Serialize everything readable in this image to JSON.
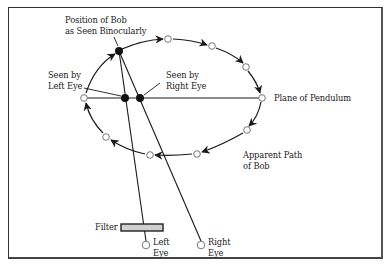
{
  "diagram": {
    "labels": {
      "position_binocular": "Position of Bob\nas Seen Binocularly",
      "seen_by_left": "Seen by\nLeft Eye",
      "seen_by_right": "Seen by\nRight Eye",
      "plane_of_pendulum": "Plane of Pendulum",
      "apparent_path": "Apparent Path\nof Bob",
      "filter": "Filter",
      "left_eye": "Left\nEye",
      "right_eye": "Right\nEye"
    },
    "colors": {
      "line": "#1a1a1a",
      "circle_stroke": "#777777",
      "filter_fill": "#cfcfcf"
    },
    "points": {
      "binocular_bob": [
        119,
        51
      ],
      "left_seen": [
        125,
        98
      ],
      "right_seen": [
        140,
        98
      ],
      "left_eye": [
        146,
        245
      ],
      "right_eye": [
        201,
        245
      ]
    },
    "path_circles": [
      [
        168,
        39
      ],
      [
        212,
        46
      ],
      [
        246,
        67
      ],
      [
        262,
        98
      ],
      [
        247,
        130
      ],
      [
        197,
        154
      ],
      [
        150,
        155
      ],
      [
        106,
        137
      ],
      [
        84,
        98
      ]
    ]
  }
}
